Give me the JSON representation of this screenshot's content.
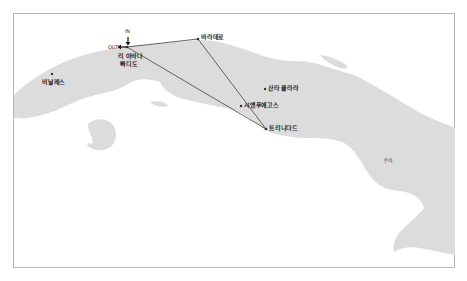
{
  "map": {
    "country_label": "쿠바",
    "land_color": "#dcdcdc",
    "sea_color": "#ffffff",
    "route_color": "#555555",
    "frame_color": "#b5b5b5"
  },
  "markers": {
    "in_label": "IN",
    "out_label": "OUT"
  },
  "cities": [
    {
      "name": "리 아바나",
      "name_line2": "빠디도",
      "x": 127,
      "y": 47,
      "role": "start-end"
    },
    {
      "name": "바라데로",
      "x": 198,
      "y": 39
    },
    {
      "name": "비날레스",
      "x": 52,
      "y": 74
    },
    {
      "name": "산타 클라라",
      "x": 265,
      "y": 89
    },
    {
      "name": "시엔푸에고스",
      "x": 241,
      "y": 106
    },
    {
      "name": "트리니다드",
      "x": 266,
      "y": 129
    }
  ],
  "route": {
    "stops": [
      "리 아바나",
      "바라데로",
      "트리니다드",
      "리 아바나"
    ]
  }
}
